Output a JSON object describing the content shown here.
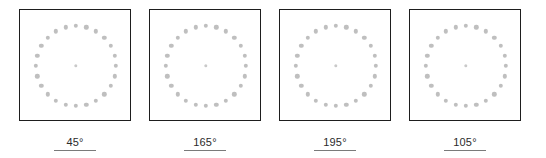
{
  "figure": {
    "kind": "dot-ring-stimulus-series",
    "panel_count": 4,
    "dot_color": "#bfbfbf",
    "center_dot_color": "#c9c9c9",
    "border_color": "#1e1e1e",
    "background_color": "#ffffff",
    "label_color": "#2b2b2b",
    "underline_color": "#7a7a7a"
  },
  "panels": [
    {
      "label": "45°",
      "angle_value": 45,
      "ring_dots": 24,
      "center_dot": true
    },
    {
      "label": "165°",
      "angle_value": 165,
      "ring_dots": 24,
      "center_dot": true
    },
    {
      "label": "195°",
      "angle_value": 195,
      "ring_dots": 24,
      "center_dot": true
    },
    {
      "label": "105°",
      "angle_value": 105,
      "ring_dots": 24,
      "center_dot": true
    }
  ],
  "chart_data": {
    "type": "scatter",
    "title": "",
    "subtitle": "",
    "xlabel": "",
    "ylabel": "",
    "grid": false,
    "legend": null,
    "panels": [
      {
        "label": "45°",
        "angle_deg": 45,
        "ring_dot_count": 24,
        "ring_radius_px": 40,
        "center_dot": true,
        "dot_diameter_px": 4.4,
        "box_size_px": 112
      },
      {
        "label": "165°",
        "angle_deg": 165,
        "ring_dot_count": 24,
        "ring_radius_px": 40,
        "center_dot": true,
        "dot_diameter_px": 4.4,
        "box_size_px": 112
      },
      {
        "label": "195°",
        "angle_deg": 195,
        "ring_dot_count": 24,
        "ring_radius_px": 40,
        "center_dot": true,
        "dot_diameter_px": 4.4,
        "box_size_px": 112
      },
      {
        "label": "105°",
        "angle_deg": 105,
        "ring_dot_count": 24,
        "ring_radius_px": 40,
        "center_dot": true,
        "dot_diameter_px": 4.4,
        "box_size_px": 112
      }
    ],
    "categories": [
      "45°",
      "165°",
      "195°",
      "105°"
    ],
    "values": [
      45,
      165,
      195,
      105
    ]
  }
}
